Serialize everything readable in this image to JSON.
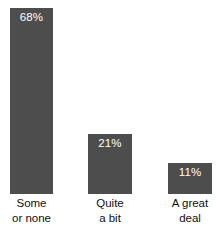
{
  "chart_data": {
    "type": "bar",
    "title": "",
    "subtitle": "",
    "xlabel": "",
    "ylabel": "",
    "ylim": [
      0,
      100
    ],
    "grid": false,
    "legend": false,
    "orientation": "vertical",
    "categories": [
      "Some or none",
      "Quite a bit",
      "A great deal"
    ],
    "category_lines": [
      [
        "Some",
        "or none"
      ],
      [
        "Quite",
        "a bit"
      ],
      [
        "A great",
        "deal"
      ]
    ],
    "values": [
      68,
      21,
      11
    ],
    "value_labels": [
      "68%",
      "21%",
      "11%"
    ],
    "value_label_position": "inside-top",
    "bar_color": "#4d4d4d",
    "value_label_color": "#ffffff",
    "category_label_color": "#101010",
    "background_color": "#ffffff",
    "bars": [
      {
        "category": "Some or none",
        "value": 68,
        "label": "68%",
        "line1": "Some",
        "line2": "or none",
        "left_px": 10,
        "width_px": 43,
        "top_px": 8,
        "height_px": 186
      },
      {
        "category": "Quite a bit",
        "value": 21,
        "label": "21%",
        "line1": "Quite",
        "line2": "a bit",
        "left_px": 88,
        "width_px": 44,
        "top_px": 134,
        "height_px": 60
      },
      {
        "category": "A great deal",
        "value": 11,
        "label": "11%",
        "line1": "A great",
        "line2": "deal",
        "left_px": 168,
        "width_px": 44,
        "top_px": 163,
        "height_px": 31
      }
    ]
  }
}
